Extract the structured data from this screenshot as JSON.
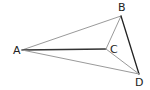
{
  "diagram": {
    "type": "geometry",
    "points": [
      {
        "name": "A",
        "x": 22,
        "y": 50,
        "label_x": 13,
        "label_y": 54
      },
      {
        "name": "B",
        "x": 121,
        "y": 16,
        "label_x": 118,
        "label_y": 11
      },
      {
        "name": "C",
        "x": 106,
        "y": 49,
        "label_x": 110,
        "label_y": 53
      },
      {
        "name": "D",
        "x": 139,
        "y": 74,
        "label_x": 135,
        "label_y": 86
      }
    ],
    "segments": [
      {
        "from": "A",
        "to": "B",
        "color": "#9a9a9a",
        "width": 1
      },
      {
        "from": "A",
        "to": "C",
        "color": "#333333",
        "width": 1.3
      },
      {
        "from": "A",
        "to": "D",
        "color": "#9a9a9a",
        "width": 1
      },
      {
        "from": "B",
        "to": "C",
        "color": "#9a9a9a",
        "width": 1
      },
      {
        "from": "B",
        "to": "D",
        "color": "#222222",
        "width": 1.3
      },
      {
        "from": "C",
        "to": "D",
        "color": "#9a9a9a",
        "width": 1
      }
    ],
    "labels": {
      "A": "A",
      "B": "B",
      "C": "C",
      "D": "D"
    }
  }
}
